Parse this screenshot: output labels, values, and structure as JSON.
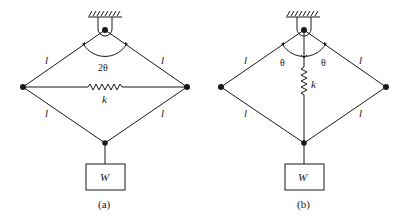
{
  "figures": [
    {
      "id": "a",
      "caption": "(a)",
      "link_labels": [
        "l",
        "l",
        "l",
        "l"
      ],
      "angle_label": "2θ",
      "spring_label": "k",
      "weight_label": "W",
      "spring_orientation": "horizontal"
    },
    {
      "id": "b",
      "caption": "(b)",
      "link_labels": [
        "l",
        "l",
        "l",
        "l"
      ],
      "angle_labels": [
        "θ",
        "θ"
      ],
      "spring_label": "k",
      "weight_label": "W",
      "spring_orientation": "vertical"
    }
  ],
  "colors": {
    "stroke": "#1a1a1a",
    "background": "#ffffff"
  }
}
